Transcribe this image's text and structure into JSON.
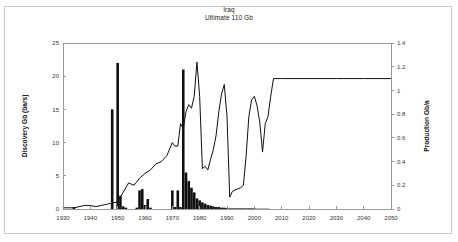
{
  "chart_data": {
    "type": "bar",
    "title": "Iraq",
    "subtitle": "Ultimate  110 Gb",
    "xlabel": "",
    "ylabel": "Discovery Gb (bars)",
    "y2label": "Production Gb/a",
    "xlim": [
      1930,
      2050
    ],
    "ylim": [
      0,
      25
    ],
    "y2lim": [
      0,
      1.4
    ],
    "grid": false,
    "legend_position": "none",
    "xticks": [
      1930,
      1940,
      1950,
      1960,
      1970,
      1980,
      1990,
      2000,
      2010,
      2020,
      2030,
      2040,
      2050
    ],
    "xtick_labels": [
      "1930",
      "1940",
      "1950",
      "1960",
      "1970",
      "1980",
      "1990",
      "2000",
      "2010",
      "2020",
      "2030",
      "2040",
      "2050"
    ],
    "yticks": [
      0,
      5,
      10,
      15,
      20,
      25
    ],
    "ytick_labels": [
      "0",
      "5",
      "10",
      "15",
      "20",
      "25"
    ],
    "y2ticks": [
      0,
      0.2,
      0.4,
      0.6,
      0.8,
      1,
      1.2,
      1.4
    ],
    "y2tick_labels": [
      "0",
      "0.2",
      "0.4",
      "0.6",
      "0.8",
      "1",
      "1.2",
      "1.4"
    ],
    "series": [
      {
        "name": "Discovery Gb (bars)",
        "type": "bar",
        "axis": "left",
        "x": [
          1930,
          1931,
          1932,
          1933,
          1934,
          1935,
          1936,
          1937,
          1938,
          1939,
          1940,
          1941,
          1942,
          1943,
          1944,
          1945,
          1946,
          1947,
          1948,
          1949,
          1950,
          1951,
          1952,
          1953,
          1954,
          1955,
          1956,
          1957,
          1958,
          1959,
          1960,
          1961,
          1962,
          1963,
          1964,
          1965,
          1966,
          1967,
          1968,
          1969,
          1970,
          1971,
          1972,
          1973,
          1974,
          1975,
          1976,
          1977,
          1978,
          1979,
          1980,
          1981,
          1982,
          1983,
          1984,
          1985,
          1986,
          1987,
          1988,
          1989,
          1990,
          1991,
          1992,
          1993,
          1994,
          1995,
          1996,
          1997,
          1998,
          1999,
          2000,
          2001,
          2002,
          2003,
          2004,
          2005
        ],
        "values": [
          0,
          0,
          0,
          0,
          0.3,
          0,
          0,
          0,
          0,
          0,
          0,
          0,
          0,
          0,
          0,
          0,
          0,
          0,
          15.0,
          0,
          22.0,
          2.0,
          0.4,
          0.2,
          0,
          0,
          0,
          0.2,
          2.8,
          3.0,
          0.6,
          1.5,
          0.2,
          0,
          0,
          0,
          0,
          0,
          0,
          0,
          2.8,
          0.3,
          2.8,
          0.3,
          21.0,
          5.5,
          4.2,
          3.2,
          2.5,
          1.6,
          1.3,
          1.0,
          0.8,
          0.6,
          0.5,
          0.4,
          0.3,
          0.3,
          0.2,
          0.2,
          0.15,
          0.1,
          0.1,
          0.1,
          0.1,
          0.1,
          0.1,
          0.1,
          0.1,
          0.1,
          0.1,
          0.05,
          0.05,
          0.05,
          0.05,
          0.05
        ]
      },
      {
        "name": "Production Gb/a",
        "type": "line",
        "axis": "right",
        "x": [
          1930,
          1934,
          1938,
          1940,
          1942,
          1944,
          1946,
          1948,
          1950,
          1952,
          1954,
          1956,
          1958,
          1960,
          1962,
          1964,
          1966,
          1968,
          1970,
          1971,
          1972,
          1973,
          1974,
          1975,
          1976,
          1977,
          1978,
          1979,
          1980,
          1981,
          1982,
          1983,
          1984,
          1985,
          1986,
          1987,
          1988,
          1989,
          1990,
          1991,
          1992,
          1993,
          1994,
          1995,
          1996,
          1997,
          1998,
          1999,
          2000,
          2001,
          2002,
          2003,
          2004,
          2005,
          2006,
          2007,
          2010,
          2020,
          2030,
          2040,
          2050
        ],
        "values": [
          0.01,
          0.01,
          0.03,
          0.03,
          0.02,
          0.03,
          0.04,
          0.05,
          0.06,
          0.14,
          0.22,
          0.2,
          0.26,
          0.3,
          0.33,
          0.38,
          0.4,
          0.45,
          0.56,
          0.53,
          0.53,
          0.72,
          0.68,
          0.82,
          0.88,
          0.85,
          0.95,
          1.24,
          0.95,
          0.34,
          0.36,
          0.33,
          0.42,
          0.5,
          0.62,
          0.82,
          0.97,
          1.05,
          0.78,
          0.1,
          0.15,
          0.16,
          0.17,
          0.18,
          0.2,
          0.45,
          0.78,
          0.92,
          0.95,
          0.87,
          0.73,
          0.48,
          0.72,
          0.78,
          0.95,
          1.1,
          1.1,
          1.1,
          1.1,
          1.1,
          1.1
        ]
      }
    ]
  },
  "colors": {
    "bar": "#101010",
    "line": "#101010",
    "axis": "#9a9a9a",
    "frame": "#c8c8c8",
    "text": "#1a1a1a"
  }
}
